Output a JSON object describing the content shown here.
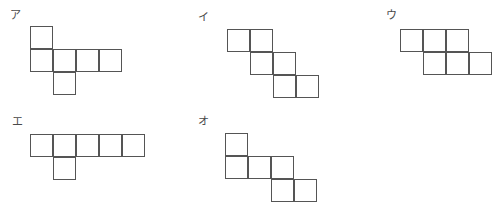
{
  "page": {
    "kind": "polyomino-net-choices",
    "background_color": "#ffffff",
    "stroke_color": "#555555",
    "label_color": "#4a4a4a",
    "cell_size": 23,
    "width": 496,
    "height": 208
  },
  "figures": [
    {
      "id": "figure-a",
      "label": "ア",
      "label_x": 10,
      "label_y": 10,
      "origin_x": 30,
      "origin_y": 26,
      "cell_count": 6,
      "cells": [
        {
          "col": 0,
          "row": 0
        },
        {
          "col": 0,
          "row": 1
        },
        {
          "col": 1,
          "row": 1
        },
        {
          "col": 2,
          "row": 1
        },
        {
          "col": 3,
          "row": 1
        },
        {
          "col": 1,
          "row": 2
        }
      ]
    },
    {
      "id": "figure-i",
      "label": "イ",
      "label_x": 198,
      "label_y": 12,
      "origin_x": 227,
      "origin_y": 29,
      "cell_count": 6,
      "cells": [
        {
          "col": 0,
          "row": 0
        },
        {
          "col": 1,
          "row": 0
        },
        {
          "col": 1,
          "row": 1
        },
        {
          "col": 2,
          "row": 1
        },
        {
          "col": 2,
          "row": 2
        },
        {
          "col": 3,
          "row": 2
        }
      ]
    },
    {
      "id": "figure-u",
      "label": "ウ",
      "label_x": 386,
      "label_y": 10,
      "origin_x": 400,
      "origin_y": 29,
      "cell_count": 6,
      "cells": [
        {
          "col": 0,
          "row": 0
        },
        {
          "col": 1,
          "row": 0
        },
        {
          "col": 2,
          "row": 0
        },
        {
          "col": 1,
          "row": 1
        },
        {
          "col": 2,
          "row": 1
        },
        {
          "col": 3,
          "row": 1
        }
      ]
    },
    {
      "id": "figure-e",
      "label": "エ",
      "label_x": 12,
      "label_y": 116,
      "origin_x": 30,
      "origin_y": 134,
      "cell_count": 6,
      "cells": [
        {
          "col": 0,
          "row": 0
        },
        {
          "col": 1,
          "row": 0
        },
        {
          "col": 2,
          "row": 0
        },
        {
          "col": 3,
          "row": 0
        },
        {
          "col": 4,
          "row": 0
        },
        {
          "col": 1,
          "row": 1
        }
      ]
    },
    {
      "id": "figure-o",
      "label": "オ",
      "label_x": 198,
      "label_y": 116,
      "origin_x": 225,
      "origin_y": 133,
      "cell_count": 6,
      "cells": [
        {
          "col": 0,
          "row": 0
        },
        {
          "col": 0,
          "row": 1
        },
        {
          "col": 1,
          "row": 1
        },
        {
          "col": 2,
          "row": 1
        },
        {
          "col": 2,
          "row": 2
        },
        {
          "col": 3,
          "row": 2
        }
      ]
    }
  ]
}
